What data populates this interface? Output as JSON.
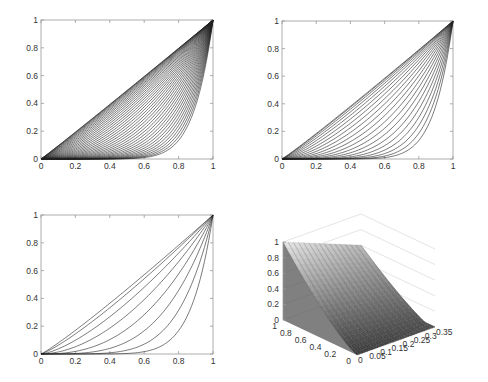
{
  "chart_data": [
    {
      "type": "line",
      "panel": "top-left",
      "title": "",
      "xlabel": "",
      "ylabel": "",
      "xlim": [
        0,
        1
      ],
      "ylim": [
        0,
        1
      ],
      "x_ticks": [
        "0",
        "0.2",
        "0.4",
        "0.6",
        "0.8",
        "1"
      ],
      "y_ticks": [
        "0",
        "0.2",
        "0.4",
        "0.6",
        "0.8",
        "1"
      ],
      "grid": false,
      "description": "Dense family of ~40 convex curves from (0,0) to (1,1), approaching the diagonal",
      "series_count": 40,
      "exponent_range": [
        1.02,
        9
      ]
    },
    {
      "type": "line",
      "panel": "top-right",
      "title": "",
      "xlabel": "",
      "ylabel": "",
      "xlim": [
        0,
        1
      ],
      "ylim": [
        0,
        1
      ],
      "x_ticks": [
        "0",
        "0.2",
        "0.4",
        "0.6",
        "0.8",
        "1"
      ],
      "y_ticks": [
        "0",
        "0.2",
        "0.4",
        "0.6",
        "0.8",
        "1"
      ],
      "grid": false,
      "description": "Family of ~20 convex curves from (0,0) to (1,1)",
      "series_count": 20,
      "exponent_range": [
        1.05,
        9
      ]
    },
    {
      "type": "line",
      "panel": "bottom-left",
      "title": "",
      "xlabel": "",
      "ylabel": "",
      "xlim": [
        0,
        1
      ],
      "ylim": [
        0,
        1
      ],
      "x_ticks": [
        "0",
        "0.2",
        "0.4",
        "0.6",
        "0.8",
        "1"
      ],
      "y_ticks": [
        "0",
        "0.2",
        "0.4",
        "0.6",
        "0.8",
        "1"
      ],
      "grid": false,
      "description": "Family of ~8 convex curves from (0,0) to (1,1)",
      "series_count": 8,
      "exponent_range": [
        1.1,
        8
      ]
    },
    {
      "type": "surface",
      "panel": "bottom-right",
      "title": "",
      "z_ticks": [
        "0",
        "0.2",
        "0.4",
        "0.6",
        "0.8",
        "1"
      ],
      "y_ticks": [
        "0",
        "0.2",
        "0.4",
        "0.6",
        "0.8",
        "1"
      ],
      "x_ticks": [
        "0",
        "0.05",
        "0.1",
        "0.15",
        "0.2",
        "0.25",
        "0.3",
        "0.35"
      ],
      "zlim": [
        0,
        1
      ],
      "ylim": [
        0,
        1
      ],
      "xlim": [
        0,
        0.35
      ],
      "grid": true,
      "colormap": "gray"
    }
  ],
  "panels": {
    "top_left": {
      "x_ticks": [
        "0",
        "0.2",
        "0.4",
        "0.6",
        "0.8",
        "1"
      ],
      "y_ticks": [
        "0",
        "0.2",
        "0.4",
        "0.6",
        "0.8",
        "1"
      ]
    },
    "top_right": {
      "x_ticks": [
        "0",
        "0.2",
        "0.4",
        "0.6",
        "0.8",
        "1"
      ],
      "y_ticks": [
        "0",
        "0.2",
        "0.4",
        "0.6",
        "0.8",
        "1"
      ]
    },
    "bottom_left": {
      "x_ticks": [
        "0",
        "0.2",
        "0.4",
        "0.6",
        "0.8",
        "1"
      ],
      "y_ticks": [
        "0",
        "0.2",
        "0.4",
        "0.6",
        "0.8",
        "1"
      ]
    },
    "surface": {
      "z_ticks": [
        "0",
        "0.2",
        "0.4",
        "0.6",
        "0.8",
        "1"
      ],
      "y_ticks": [
        "1",
        "0.8",
        "0.6",
        "0.4",
        "0.2",
        "0"
      ],
      "x_ticks": [
        "0",
        "0.05",
        "0.1",
        "0.15",
        "0.2",
        "0.25",
        "0.3",
        "0.35"
      ]
    }
  }
}
